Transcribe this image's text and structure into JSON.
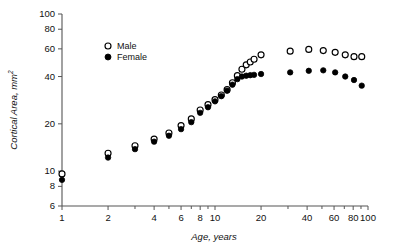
{
  "chart_data": {
    "type": "scatter",
    "title": "",
    "xlabel": "Age, years",
    "ylabel": "Cortical Area, mm",
    "ylabel_superscript": "2",
    "xscale": "log",
    "yscale": "log",
    "xlim": [
      1,
      100
    ],
    "ylim": [
      6,
      100
    ],
    "grid": false,
    "legend_position": "upper-left-inside",
    "xticks": [
      1,
      2,
      4,
      6,
      8,
      10,
      20,
      40,
      60,
      80,
      100
    ],
    "xtick_labels": [
      "1",
      "2",
      "4",
      "6",
      "8",
      "10",
      "20",
      "40",
      "60",
      "80",
      "100"
    ],
    "yticks": [
      6,
      8,
      10,
      20,
      40,
      60,
      80,
      100
    ],
    "ytick_labels": [
      "6",
      "8",
      "10",
      "20",
      "40",
      "60",
      "80",
      "100"
    ],
    "series": [
      {
        "name": "Male",
        "marker": "open-circle",
        "color": "#000000",
        "points": [
          {
            "x": 1,
            "y": 9.6
          },
          {
            "x": 2,
            "y": 13.0
          },
          {
            "x": 3,
            "y": 14.5
          },
          {
            "x": 4,
            "y": 16.0
          },
          {
            "x": 5,
            "y": 17.5
          },
          {
            "x": 6,
            "y": 19.5
          },
          {
            "x": 7,
            "y": 21.5
          },
          {
            "x": 8,
            "y": 24.5
          },
          {
            "x": 9,
            "y": 26.5
          },
          {
            "x": 10,
            "y": 28.5
          },
          {
            "x": 11,
            "y": 30.5
          },
          {
            "x": 12,
            "y": 33.0
          },
          {
            "x": 13,
            "y": 36.5
          },
          {
            "x": 14,
            "y": 40.5
          },
          {
            "x": 15,
            "y": 44.5
          },
          {
            "x": 16,
            "y": 47.5
          },
          {
            "x": 17,
            "y": 49.5
          },
          {
            "x": 18,
            "y": 51.5
          },
          {
            "x": 20,
            "y": 55.0
          },
          {
            "x": 31,
            "y": 58.0
          },
          {
            "x": 41,
            "y": 59.5
          },
          {
            "x": 51,
            "y": 58.5
          },
          {
            "x": 61,
            "y": 57.0
          },
          {
            "x": 71,
            "y": 55.0
          },
          {
            "x": 81,
            "y": 53.5
          },
          {
            "x": 91,
            "y": 53.5
          }
        ]
      },
      {
        "name": "Female",
        "marker": "filled-circle",
        "color": "#000000",
        "points": [
          {
            "x": 1,
            "y": 8.8
          },
          {
            "x": 2,
            "y": 12.2
          },
          {
            "x": 3,
            "y": 13.8
          },
          {
            "x": 4,
            "y": 15.4
          },
          {
            "x": 5,
            "y": 16.8
          },
          {
            "x": 6,
            "y": 18.5
          },
          {
            "x": 7,
            "y": 20.5
          },
          {
            "x": 8,
            "y": 23.5
          },
          {
            "x": 9,
            "y": 25.5
          },
          {
            "x": 10,
            "y": 27.8
          },
          {
            "x": 11,
            "y": 30.0
          },
          {
            "x": 12,
            "y": 32.5
          },
          {
            "x": 13,
            "y": 35.5
          },
          {
            "x": 14,
            "y": 38.5
          },
          {
            "x": 15,
            "y": 40.0
          },
          {
            "x": 16,
            "y": 40.5
          },
          {
            "x": 17,
            "y": 40.8
          },
          {
            "x": 18,
            "y": 41.0
          },
          {
            "x": 20,
            "y": 41.5
          },
          {
            "x": 31,
            "y": 42.5
          },
          {
            "x": 41,
            "y": 43.5
          },
          {
            "x": 51,
            "y": 43.8
          },
          {
            "x": 61,
            "y": 42.5
          },
          {
            "x": 71,
            "y": 40.0
          },
          {
            "x": 81,
            "y": 38.0
          },
          {
            "x": 91,
            "y": 35.0
          }
        ]
      }
    ]
  },
  "legend": {
    "entries": [
      {
        "label": "Male",
        "marker": "open-circle"
      },
      {
        "label": "Female",
        "marker": "filled-circle"
      }
    ]
  }
}
